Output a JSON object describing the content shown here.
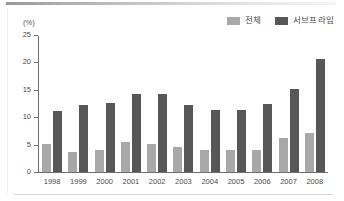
{
  "figure": {
    "unit_label": "(%)"
  },
  "legend": {
    "position": "top-right",
    "items": [
      {
        "label": "전체",
        "color": "#a8a8a8",
        "swatch_icon": "legend-swatch-icon"
      },
      {
        "label": "서브프라임",
        "color": "#575757",
        "swatch_icon": "legend-swatch-icon"
      }
    ]
  },
  "chart_data": {
    "type": "bar",
    "title": "",
    "subtitle": "",
    "xlabel": "",
    "ylabel": "(%)",
    "ylim": [
      0,
      25
    ],
    "yticks": [
      0,
      5,
      10,
      15,
      20,
      25
    ],
    "ytick_labels": [
      "0",
      "5",
      "10",
      "15",
      "20",
      "25"
    ],
    "grid": false,
    "legend_position": "top-right",
    "categories": [
      "1998",
      "1999",
      "2000",
      "2001",
      "2002",
      "2003",
      "2004",
      "2005",
      "2006",
      "2007",
      "2008"
    ],
    "series": [
      {
        "name": "전체",
        "color": "#a8a8a8",
        "values": [
          5.1,
          3.7,
          4.1,
          5.4,
          5.2,
          4.5,
          4.0,
          4.0,
          4.0,
          6.2,
          7.1
        ]
      },
      {
        "name": "서브프라임",
        "color": "#575757",
        "values": [
          11.2,
          12.2,
          12.6,
          14.2,
          14.2,
          12.3,
          11.3,
          11.4,
          12.4,
          15.2,
          20.6
        ]
      }
    ]
  }
}
